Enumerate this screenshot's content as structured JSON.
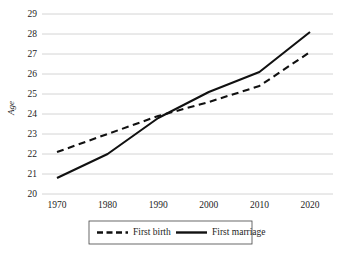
{
  "chart_data": {
    "type": "line",
    "title": "",
    "xlabel": "",
    "ylabel": "Age",
    "x": [
      1970,
      1980,
      1990,
      2000,
      2010,
      2020
    ],
    "categories": [
      "1970",
      "1980",
      "1990",
      "2000",
      "2010",
      "2020"
    ],
    "xlim": [
      1970,
      2020
    ],
    "ylim": [
      20,
      29
    ],
    "yticks": [
      20,
      21,
      22,
      23,
      24,
      25,
      26,
      27,
      28,
      29
    ],
    "ytick_labels": [
      "20",
      "21",
      "22",
      "23",
      "24",
      "25",
      "26",
      "27",
      "28",
      "29"
    ],
    "xticks": [
      1970,
      1980,
      1990,
      2000,
      2010,
      2020
    ],
    "xtick_labels": [
      "1970",
      "1980",
      "1990",
      "2000",
      "2010",
      "2020"
    ],
    "grid": "horizontal",
    "legend_position": "bottom",
    "series": [
      {
        "name": "First birth",
        "style": "dashed",
        "color": "#111111",
        "values": [
          22.1,
          23.0,
          23.9,
          24.6,
          25.4,
          27.1
        ]
      },
      {
        "name": "First marriage",
        "style": "solid",
        "color": "#111111",
        "values": [
          20.8,
          22.0,
          23.8,
          25.1,
          26.1,
          28.1
        ]
      }
    ],
    "colors": {
      "background": "#ffffff",
      "gridline": "#c9c9c9",
      "line": "#111111",
      "text": "#1d1d1d",
      "legend_border": "#444444"
    }
  }
}
